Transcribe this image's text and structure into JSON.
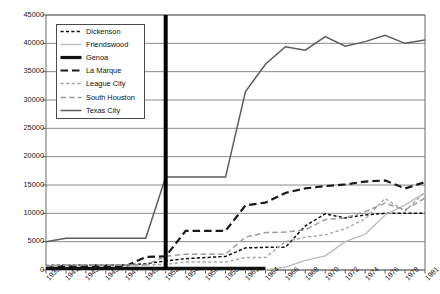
{
  "chart_data": {
    "type": "line",
    "title": "",
    "xlabel": "",
    "ylabel": "",
    "ylim": [
      0,
      45000
    ],
    "ytick_values": [
      0,
      5000,
      10000,
      15000,
      20000,
      25000,
      30000,
      35000,
      40000,
      45000
    ],
    "ytick_labels": [
      "0",
      "5000",
      "10000",
      "15000",
      "20000",
      "25000",
      "30000",
      "35000",
      "40000",
      "45000"
    ],
    "grid": "horizontal",
    "legend_position": "upper-left-inside",
    "categories": [
      "1939",
      "1941",
      "1943",
      "1945",
      "1947",
      "1949",
      "1952",
      "1954",
      "1956",
      "1958",
      "1961",
      "1964",
      "1966",
      "1968",
      "1970",
      "1972",
      "1974",
      "1976",
      "1978",
      "1981"
    ],
    "annotations": [
      {
        "name": "vertical-marker-1952",
        "x_category": "1952",
        "color": "#000000",
        "width_px": 4
      }
    ],
    "series": [
      {
        "name": "Dickenson",
        "style": "fine-dashed",
        "color": "#111111",
        "values": [
          800,
          900,
          900,
          900,
          900,
          1100,
          1600,
          2000,
          2200,
          2400,
          3900,
          4000,
          4000,
          7800,
          9900,
          9200,
          9700,
          10000,
          10000,
          10000
        ]
      },
      {
        "name": "Friendswood",
        "style": "solid-thin",
        "color": "#b9b9b9",
        "values": [
          0,
          0,
          0,
          0,
          0,
          0,
          0,
          0,
          0,
          0,
          0,
          0,
          500,
          1700,
          2500,
          5000,
          6300,
          9700,
          11500,
          13600
        ]
      },
      {
        "name": "Genoa",
        "style": "solid-thick",
        "color": "#111111",
        "values": [
          300,
          300,
          300,
          300,
          300,
          300,
          300,
          300,
          300,
          300,
          300,
          300,
          null,
          null,
          null,
          null,
          null,
          null,
          null,
          null
        ]
      },
      {
        "name": "La Marque",
        "style": "coarse-dashed",
        "color": "#1a1a1a",
        "values": [
          600,
          700,
          700,
          700,
          700,
          2300,
          2400,
          6900,
          6900,
          6900,
          11400,
          11900,
          13600,
          14400,
          14800,
          15100,
          15600,
          15800,
          14400,
          15500
        ]
      },
      {
        "name": "League City",
        "style": "fine-dashed-light",
        "color": "#a8a8a8",
        "values": [
          700,
          900,
          900,
          900,
          900,
          900,
          1000,
          1400,
          1400,
          1400,
          2200,
          2200,
          5000,
          5800,
          6200,
          7300,
          9000,
          12600,
          10400,
          13800
        ]
      },
      {
        "name": "South Houston",
        "style": "medium-dashed-light",
        "color": "#9c9c9c",
        "values": [
          700,
          900,
          900,
          900,
          900,
          900,
          2400,
          2800,
          2800,
          2800,
          5800,
          6600,
          6700,
          7100,
          8900,
          9200,
          10300,
          11800,
          10600,
          12700
        ]
      },
      {
        "name": "Texas City",
        "style": "solid-medium",
        "color": "#5c5c5c",
        "values": [
          5000,
          5600,
          5600,
          5600,
          5600,
          5600,
          16400,
          16400,
          16400,
          16400,
          31500,
          36300,
          39400,
          38800,
          41200,
          39500,
          40300,
          41400,
          40000,
          40600
        ]
      }
    ]
  }
}
